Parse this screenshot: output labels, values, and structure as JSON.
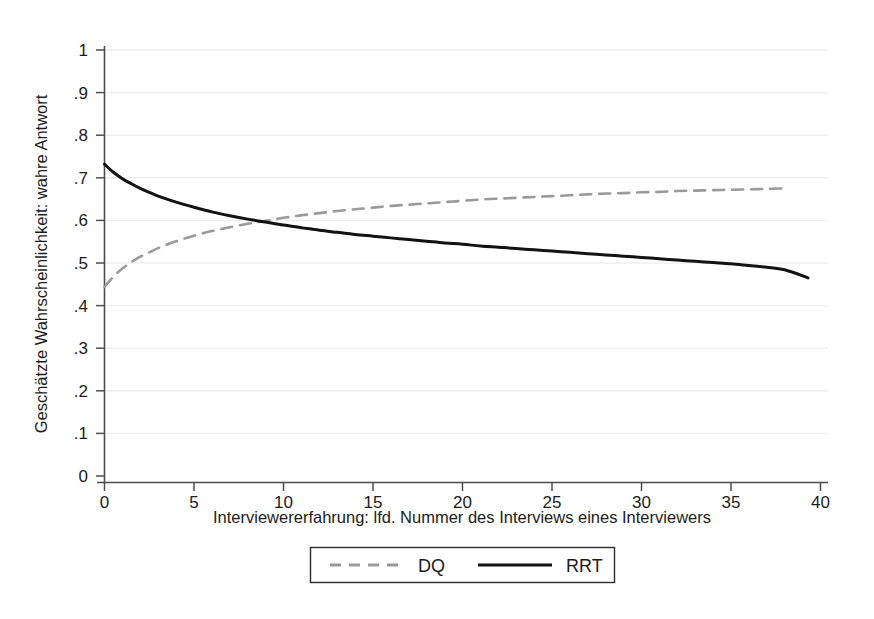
{
  "chart_data": {
    "type": "line",
    "title": "",
    "subtitle": "",
    "xlabel": "Interviewererfahrung: lfd. Nummer des Interviews eines Interviewers",
    "ylabel": "Geschätzte Wahrscheinlichkeit: wahre Antwort",
    "xlim": [
      0,
      40
    ],
    "ylim": [
      0,
      1
    ],
    "xticks": [
      0,
      5,
      10,
      15,
      20,
      25,
      30,
      35,
      40
    ],
    "xtick_labels": [
      "0",
      "5",
      "10",
      "15",
      "20",
      "25",
      "30",
      "35",
      "40"
    ],
    "yticks": [
      0,
      0.1,
      0.2,
      0.3,
      0.4,
      0.5,
      0.6,
      0.7,
      0.8,
      0.9,
      1
    ],
    "ytick_labels": [
      "0",
      ".1",
      ".2",
      ".3",
      ".4",
      ".5",
      ".6",
      ".7",
      ".8",
      ".9",
      "1"
    ],
    "grid": "horizontal-faint",
    "grid_color": "#efefef",
    "legend_position": "bottom-center",
    "background": "#ffffff",
    "axis_color": "#4d4d4d",
    "crossing_point": {
      "x": 7.4,
      "y": 0.596
    },
    "series": [
      {
        "name": "DQ",
        "style": "dashed",
        "color": "#9a9a9a",
        "width": 2.6,
        "x": [
          0,
          0.5,
          1,
          1.5,
          2,
          2.5,
          3,
          4,
          5,
          6,
          7,
          8,
          9,
          10,
          11,
          12,
          13,
          14,
          15,
          16,
          17,
          18,
          19,
          20,
          21,
          22,
          23,
          24,
          25,
          26,
          27,
          28,
          29,
          30,
          31,
          32,
          33,
          34,
          35,
          36,
          37,
          38
        ],
        "y": [
          0.444,
          0.468,
          0.487,
          0.502,
          0.515,
          0.525,
          0.535,
          0.551,
          0.564,
          0.575,
          0.584,
          0.592,
          0.599,
          0.606,
          0.612,
          0.617,
          0.622,
          0.626,
          0.63,
          0.634,
          0.637,
          0.64,
          0.643,
          0.646,
          0.649,
          0.651,
          0.653,
          0.655,
          0.657,
          0.659,
          0.661,
          0.663,
          0.664,
          0.666,
          0.667,
          0.669,
          0.67,
          0.671,
          0.672,
          0.673,
          0.674,
          0.675
        ]
      },
      {
        "name": "RRT",
        "style": "solid",
        "color": "#121212",
        "width": 3.0,
        "x": [
          0,
          0.5,
          1,
          1.5,
          2,
          2.5,
          3,
          4,
          5,
          6,
          7,
          8,
          9,
          10,
          11,
          12,
          13,
          14,
          15,
          16,
          17,
          18,
          19,
          20,
          21,
          22,
          23,
          24,
          25,
          26,
          27,
          28,
          29,
          30,
          31,
          32,
          33,
          34,
          35,
          36,
          37,
          38,
          39.3
        ],
        "y": [
          0.732,
          0.713,
          0.698,
          0.686,
          0.675,
          0.666,
          0.657,
          0.643,
          0.631,
          0.62,
          0.611,
          0.603,
          0.596,
          0.589,
          0.583,
          0.577,
          0.572,
          0.567,
          0.563,
          0.559,
          0.555,
          0.551,
          0.547,
          0.544,
          0.54,
          0.537,
          0.534,
          0.531,
          0.528,
          0.525,
          0.522,
          0.519,
          0.516,
          0.513,
          0.51,
          0.507,
          0.504,
          0.501,
          0.498,
          0.494,
          0.49,
          0.484,
          0.465
        ]
      }
    ]
  },
  "legend": {
    "items": [
      {
        "label": "DQ",
        "style": "dashed",
        "color": "#9a9a9a"
      },
      {
        "label": "RRT",
        "style": "solid",
        "color": "#121212"
      }
    ]
  },
  "axes": {
    "y_title": "Geschätzte Wahrscheinlichkeit: wahre Antwort",
    "x_title": "Interviewererfahrung: lfd. Nummer des Interviews eines Interviewers",
    "y_labels": [
      "1",
      ".9",
      ".8",
      ".7",
      ".6",
      ".5",
      ".4",
      ".3",
      ".2",
      ".1",
      "0"
    ],
    "x_labels": [
      "0",
      "5",
      "10",
      "15",
      "20",
      "25",
      "30",
      "35",
      "40"
    ]
  }
}
